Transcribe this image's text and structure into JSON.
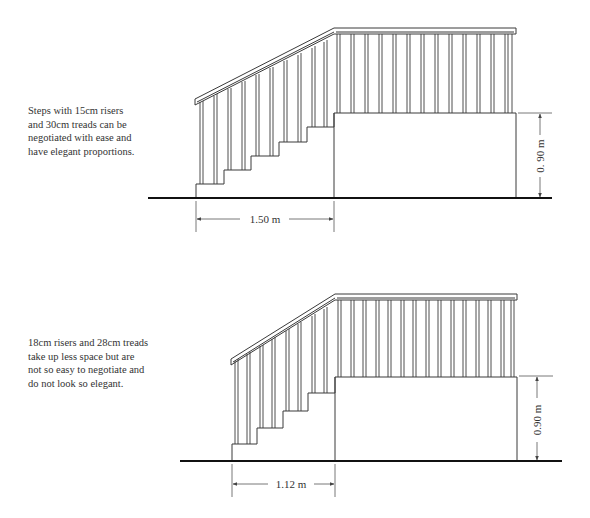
{
  "figures": [
    {
      "id": "comfortable-stair",
      "caption_lines": [
        "Steps with 15cm risers",
        "and 30cm treads can be",
        "negotiated with ease and",
        "have elegant proportions."
      ],
      "riser_cm": 15,
      "tread_cm": 30,
      "horizontal_dimension": "1.50 m",
      "vertical_dimension": "0. 90 m"
    },
    {
      "id": "steep-stair",
      "caption_lines": [
        "18cm risers and 28cm treads",
        "take up less space but are",
        "not so easy to negotiate and",
        "do not look so elegant."
      ],
      "riser_cm": 18,
      "tread_cm": 28,
      "horizontal_dimension": "1.12 m",
      "vertical_dimension": "0.90 m"
    }
  ],
  "colors": {
    "line": "#3a3a3a",
    "ground": "#111111",
    "dimension": "#555555"
  }
}
